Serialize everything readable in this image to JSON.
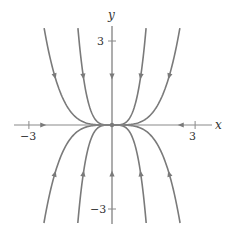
{
  "diagram": {
    "type": "phase-portrait",
    "axes": {
      "x_label": "x",
      "y_label": "y",
      "x_ticks": [
        {
          "value": -3,
          "label": "−3"
        },
        {
          "value": 3,
          "label": "3"
        }
      ],
      "y_ticks": [
        {
          "value": 3,
          "label": "3"
        },
        {
          "value": -3,
          "label": "−3"
        }
      ],
      "x_range": [
        -4,
        4
      ],
      "y_range": [
        -3.5,
        3.9
      ]
    },
    "equilibrium": {
      "x": 0,
      "y": 0,
      "type": "stable node"
    },
    "trajectories": {
      "family": "y = c x^4",
      "coefficients": [
        0.096,
        1.51,
        -0.096,
        -1.51
      ],
      "vertical_axis_trajectory": true,
      "horizontal_axis_trajectory": true,
      "direction": "toward origin"
    },
    "colors": {
      "curve": "#7a7a7a",
      "axis": "#8a8a8a",
      "text": "#333333"
    }
  }
}
